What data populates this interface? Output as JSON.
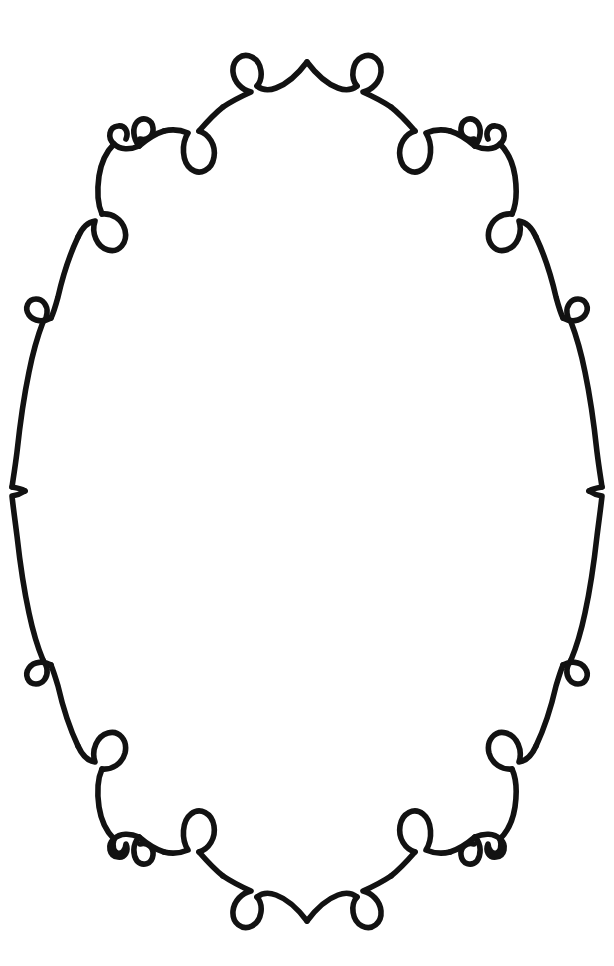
{
  "artwork": {
    "title": "Ornamental Oval Frame",
    "medium": "hand-drawn ink line art",
    "canvas": {
      "width": 614,
      "height": 966,
      "background_color": "#ffffff"
    },
    "ink_color": "#121212",
    "stroke_width_px": 5.6,
    "symmetry": {
      "vertical_axis_x": 307,
      "horizontal_axis_y": 483,
      "description": "bilaterally symmetric about both axes"
    }
  },
  "frame": {
    "shape": "oval",
    "outer_bounds": {
      "left": 10,
      "top": 58,
      "right": 604,
      "bottom": 908
    },
    "apex_top": {
      "x": 307,
      "y": 62,
      "type": "sharp-peak"
    },
    "apex_bottom": {
      "x": 307,
      "y": 903,
      "type": "sharp-vee"
    },
    "widest_left_x": 10,
    "widest_right_x": 604,
    "ornaments": [
      {
        "name": "apex-loop-top-left",
        "type": "teardrop-loop",
        "x": 243,
        "y": 76
      },
      {
        "name": "apex-loop-top-right",
        "type": "teardrop-loop",
        "x": 371,
        "y": 76
      },
      {
        "name": "arc-loop-top-left",
        "type": "teardrop-loop",
        "x": 196,
        "y": 137
      },
      {
        "name": "arc-loop-top-right",
        "type": "teardrop-loop",
        "x": 418,
        "y": 137
      },
      {
        "name": "corner-curl-top-left",
        "type": "double-spiral-curl",
        "x": 123,
        "y": 140
      },
      {
        "name": "corner-curl-top-right",
        "type": "double-spiral-curl",
        "x": 491,
        "y": 140
      },
      {
        "name": "upper-loop-left",
        "type": "teardrop-loop",
        "x": 87,
        "y": 228
      },
      {
        "name": "upper-loop-right",
        "type": "teardrop-loop",
        "x": 527,
        "y": 228
      },
      {
        "name": "side-ring-left",
        "type": "small-circle-loop",
        "x": 33,
        "y": 312
      },
      {
        "name": "side-ring-right",
        "type": "small-circle-loop",
        "x": 581,
        "y": 312
      },
      {
        "name": "mid-notch-left",
        "type": "inward-point",
        "x": 12,
        "y": 487
      },
      {
        "name": "mid-notch-right",
        "type": "inward-point",
        "x": 602,
        "y": 487
      },
      {
        "name": "lower-ring-left",
        "type": "small-circle-loop",
        "x": 33,
        "y": 658
      },
      {
        "name": "lower-ring-right",
        "type": "small-circle-loop",
        "x": 581,
        "y": 658
      },
      {
        "name": "lower-loop-left",
        "type": "teardrop-loop",
        "x": 87,
        "y": 742
      },
      {
        "name": "lower-loop-right",
        "type": "teardrop-loop",
        "x": 527,
        "y": 742
      },
      {
        "name": "corner-curl-bottom-left",
        "type": "double-spiral-curl",
        "x": 123,
        "y": 829
      },
      {
        "name": "corner-curl-bottom-right",
        "type": "double-spiral-curl",
        "x": 491,
        "y": 829
      },
      {
        "name": "arc-loop-bottom-left",
        "type": "teardrop-loop",
        "x": 196,
        "y": 838
      },
      {
        "name": "arc-loop-bottom-right",
        "type": "teardrop-loop",
        "x": 418,
        "y": 838
      },
      {
        "name": "apex-loop-bottom-left",
        "type": "teardrop-loop",
        "x": 243,
        "y": 898
      },
      {
        "name": "apex-loop-bottom-right",
        "type": "teardrop-loop",
        "x": 371,
        "y": 898
      }
    ],
    "ornament_counts": {
      "teardrop_loops": 12,
      "small_circle_loops": 4,
      "double_spiral_curls": 4,
      "inward_points": 2,
      "sharp_apexes": 2
    }
  },
  "interior": {
    "content": "",
    "is_empty": true
  }
}
